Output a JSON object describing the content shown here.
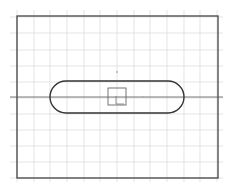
{
  "canvas": {
    "width": 233,
    "height": 190,
    "background": "#ffffff"
  },
  "grid": {
    "color": "#d9d9d9",
    "x_lines": [
      17,
      34,
      50,
      67,
      84,
      100,
      117,
      134,
      150,
      167,
      184,
      200,
      217
    ],
    "y_lines": [
      17,
      33,
      50,
      66,
      82,
      98,
      114,
      130,
      146,
      162,
      178
    ]
  },
  "border": {
    "x": 17,
    "y": 16,
    "width": 201,
    "height": 162,
    "color": "#444444"
  },
  "center_line": {
    "y": 97,
    "x1": 10,
    "x2": 223,
    "color": "#555555"
  },
  "slot": {
    "x": 50,
    "y": 81,
    "width": 134,
    "height": 32,
    "color": "#333333"
  },
  "square": {
    "x": 108,
    "y": 88,
    "width": 18,
    "height": 17,
    "color": "#666666"
  },
  "marker_small": {
    "x": 116,
    "y": 96,
    "w": 8,
    "h": 8
  },
  "points": [
    {
      "x": 117,
      "y": 72
    },
    {
      "x": 143,
      "y": 97
    }
  ]
}
